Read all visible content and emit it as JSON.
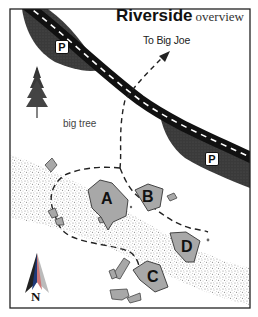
{
  "title": {
    "main": "Riverside",
    "sub": "overview"
  },
  "labels": {
    "destination": "To Big Joe",
    "tree": "big tree",
    "north": "N"
  },
  "parking": [
    {
      "id": "parking-north",
      "label": "P"
    },
    {
      "id": "parking-east",
      "label": "P"
    }
  ],
  "boulders": [
    {
      "id": "A",
      "label": "A"
    },
    {
      "id": "B",
      "label": "B"
    },
    {
      "id": "C",
      "label": "C"
    },
    {
      "id": "D",
      "label": "D"
    }
  ],
  "colors": {
    "road": "#111111",
    "road_dash": "#ffffff",
    "parking_area": "#3a3a3a",
    "river_stipple": "#9a9a9a",
    "boulder_fill": "#a8a8a8",
    "boulder_stroke": "#444444",
    "trail": "#222222",
    "border": "#222222"
  }
}
